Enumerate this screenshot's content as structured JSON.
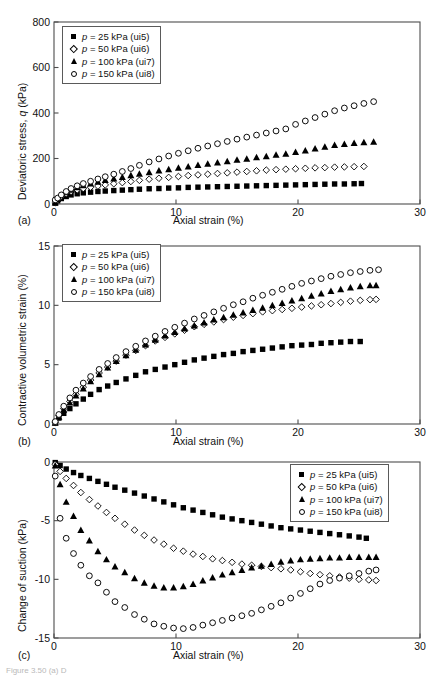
{
  "figure": {
    "caption_fragment": "Figure 3.50 (a) D",
    "panel_labels": [
      "(a)",
      "(b)",
      "(c)"
    ],
    "xlabel": "Axial strain (%)",
    "series_styles": [
      "filled-square",
      "open-diamond",
      "filled-triangle",
      "open-circle"
    ],
    "legend_labels": [
      "p = 25 kPa (ui5)",
      "p = 50 kPa (ui6)",
      "p = 100 kPa (ui7)",
      "p = 150 kPa (ui8)"
    ],
    "legend_parts": [
      {
        "sym": "p",
        "rest": " = 25 kPa (ui5)"
      },
      {
        "sym": "p",
        "rest": " = 50 kPa (ui6)"
      },
      {
        "sym": "p",
        "rest": " = 100 kPa (ui7)"
      },
      {
        "sym": "p",
        "rest": " = 150 kPa (ui8)"
      }
    ]
  },
  "chart_data": [
    {
      "panel": "(a)",
      "type": "scatter",
      "title": "",
      "xlabel": "Axial strain (%)",
      "ylabel": "Deviatoric stress, q (kPa)",
      "ylabel_plain": "Deviatoric stress, q (kPa)",
      "xlim": [
        0,
        30
      ],
      "ylim": [
        0,
        800
      ],
      "xticks": [
        0,
        10,
        20,
        30
      ],
      "yticks": [
        0,
        200,
        400,
        600,
        800
      ],
      "grid": false,
      "legend_position": "top-left",
      "series": [
        {
          "name": "p = 25 kPa (ui5)",
          "marker": "filled-square",
          "x": [
            0.1,
            0.3,
            0.6,
            1.0,
            1.4,
            1.9,
            2.4,
            3.0,
            3.6,
            4.2,
            4.9,
            5.6,
            6.3,
            7.0,
            7.8,
            8.6,
            9.4,
            10.2,
            11.0,
            11.8,
            12.6,
            13.4,
            14.2,
            15.0,
            15.8,
            16.6,
            17.4,
            18.2,
            19.0,
            19.8,
            20.6,
            21.4,
            22.2,
            23.0,
            23.8,
            24.6,
            25.2
          ],
          "y": [
            4,
            14,
            24,
            33,
            40,
            45,
            49,
            52,
            55,
            57,
            59,
            61,
            63,
            65,
            67,
            68,
            70,
            71,
            73,
            74,
            75,
            76,
            77,
            78,
            79,
            80,
            81,
            82,
            83,
            84,
            85,
            86,
            87,
            88,
            88,
            89,
            90
          ]
        },
        {
          "name": "p = 50 kPa (ui6)",
          "marker": "open-diamond",
          "x": [
            0.1,
            0.3,
            0.6,
            1.0,
            1.4,
            1.9,
            2.4,
            3.0,
            3.6,
            4.2,
            4.9,
            5.6,
            6.3,
            7.0,
            7.8,
            8.6,
            9.4,
            10.2,
            11.0,
            11.8,
            12.6,
            13.4,
            14.2,
            15.0,
            15.8,
            16.6,
            17.4,
            18.2,
            19.0,
            19.8,
            20.6,
            21.4,
            22.2,
            23.0,
            23.8,
            24.6,
            25.4
          ],
          "y": [
            6,
            19,
            33,
            45,
            55,
            62,
            68,
            74,
            79,
            84,
            89,
            94,
            99,
            104,
            109,
            113,
            117,
            121,
            125,
            128,
            131,
            134,
            137,
            140,
            143,
            146,
            149,
            151,
            153,
            155,
            157,
            159,
            160,
            162,
            163,
            164,
            165
          ]
        },
        {
          "name": "p = 100 kPa (ui7)",
          "marker": "filled-triangle",
          "x": [
            0.1,
            0.3,
            0.6,
            1.0,
            1.4,
            1.9,
            2.4,
            3.0,
            3.6,
            4.2,
            4.9,
            5.6,
            6.3,
            7.0,
            7.8,
            8.6,
            9.4,
            10.2,
            11.0,
            11.8,
            12.6,
            13.4,
            14.2,
            15.0,
            15.8,
            16.6,
            17.4,
            18.2,
            19.0,
            19.8,
            20.6,
            21.4,
            22.2,
            23.0,
            23.8,
            24.6,
            25.4,
            26.2
          ],
          "y": [
            7,
            22,
            38,
            52,
            63,
            73,
            82,
            90,
            98,
            105,
            112,
            119,
            126,
            133,
            140,
            147,
            153,
            159,
            165,
            171,
            177,
            182,
            188,
            194,
            199,
            205,
            210,
            216,
            221,
            229,
            235,
            244,
            252,
            259,
            264,
            268,
            271,
            274
          ]
        },
        {
          "name": "p = 150 kPa (ui8)",
          "marker": "open-circle",
          "x": [
            0.1,
            0.3,
            0.6,
            1.0,
            1.4,
            1.9,
            2.4,
            3.0,
            3.6,
            4.2,
            4.9,
            5.6,
            6.3,
            7.0,
            7.8,
            8.6,
            9.4,
            10.2,
            11.0,
            11.8,
            12.6,
            13.4,
            14.2,
            15.0,
            15.8,
            16.6,
            17.4,
            18.2,
            19.0,
            19.8,
            20.6,
            21.4,
            22.2,
            23.0,
            23.8,
            24.6,
            25.4,
            26.2
          ],
          "y": [
            18,
            26,
            40,
            55,
            68,
            80,
            90,
            100,
            110,
            120,
            131,
            143,
            156,
            170,
            185,
            198,
            211,
            223,
            234,
            245,
            255,
            265,
            275,
            285,
            294,
            303,
            312,
            321,
            330,
            350,
            365,
            380,
            395,
            410,
            422,
            432,
            442,
            450
          ]
        }
      ]
    },
    {
      "panel": "(b)",
      "type": "scatter",
      "title": "",
      "xlabel": "Axial strain (%)",
      "ylabel": "Contractive volumetric strain (%)",
      "ylabel_plain": "Contractive volumetric strain (%)",
      "xlim": [
        0,
        30
      ],
      "ylim": [
        0,
        15
      ],
      "xticks": [
        0,
        10,
        20,
        30
      ],
      "yticks": [
        0,
        5,
        10,
        15
      ],
      "grid": false,
      "legend_position": "top-left",
      "series": [
        {
          "name": "p = 25 kPa (ui5)",
          "marker": "filled-square",
          "x": [
            0.1,
            0.4,
            0.8,
            1.3,
            1.8,
            2.4,
            3.0,
            3.7,
            4.4,
            5.1,
            5.9,
            6.7,
            7.5,
            8.3,
            9.1,
            9.9,
            10.7,
            11.5,
            12.3,
            13.1,
            13.9,
            14.7,
            15.5,
            16.3,
            17.1,
            17.9,
            18.7,
            19.5,
            20.3,
            21.1,
            21.9,
            22.7,
            23.5,
            24.3,
            25.1
          ],
          "y": [
            0.1,
            0.5,
            0.9,
            1.3,
            1.7,
            2.1,
            2.5,
            2.9,
            3.2,
            3.5,
            3.8,
            4.1,
            4.4,
            4.6,
            4.8,
            5.0,
            5.2,
            5.4,
            5.55,
            5.7,
            5.85,
            5.95,
            6.1,
            6.2,
            6.3,
            6.4,
            6.5,
            6.6,
            6.65,
            6.7,
            6.8,
            6.85,
            6.9,
            6.95,
            6.95
          ]
        },
        {
          "name": "p = 50 kPa (ui6)",
          "marker": "open-diamond",
          "x": [
            0.1,
            0.4,
            0.8,
            1.3,
            1.8,
            2.4,
            3.0,
            3.7,
            4.4,
            5.1,
            5.9,
            6.7,
            7.5,
            8.3,
            9.1,
            9.9,
            10.7,
            11.5,
            12.3,
            13.1,
            13.9,
            14.7,
            15.5,
            16.3,
            17.1,
            17.9,
            18.7,
            19.5,
            20.3,
            21.1,
            21.9,
            22.7,
            23.5,
            24.3,
            25.1,
            25.9,
            26.4
          ],
          "y": [
            0.15,
            0.7,
            1.3,
            1.9,
            2.5,
            3.1,
            3.7,
            4.3,
            4.8,
            5.3,
            5.8,
            6.2,
            6.6,
            7.0,
            7.3,
            7.6,
            7.9,
            8.2,
            8.4,
            8.6,
            8.8,
            9.0,
            9.15,
            9.3,
            9.45,
            9.55,
            9.65,
            9.75,
            9.85,
            9.95,
            10.05,
            10.15,
            10.25,
            10.35,
            10.42,
            10.48,
            10.5
          ]
        },
        {
          "name": "p = 100 kPa (ui7)",
          "marker": "filled-triangle",
          "x": [
            0.1,
            0.4,
            0.8,
            1.3,
            1.8,
            2.4,
            3.0,
            3.7,
            4.4,
            5.1,
            5.9,
            6.7,
            7.5,
            8.3,
            9.1,
            9.9,
            10.7,
            11.5,
            12.3,
            13.1,
            13.9,
            14.7,
            15.5,
            16.3,
            17.1,
            17.9,
            18.7,
            19.5,
            20.3,
            21.1,
            21.9,
            22.7,
            23.5,
            24.3,
            25.1,
            25.9,
            26.4
          ],
          "y": [
            0.1,
            0.6,
            1.2,
            1.8,
            2.4,
            3.0,
            3.6,
            4.2,
            4.75,
            5.3,
            5.8,
            6.25,
            6.7,
            7.1,
            7.45,
            7.75,
            8.05,
            8.3,
            8.55,
            8.8,
            9.0,
            9.2,
            9.4,
            9.6,
            9.8,
            10.0,
            10.2,
            10.4,
            10.6,
            10.8,
            11.0,
            11.2,
            11.35,
            11.5,
            11.6,
            11.68,
            11.7
          ]
        },
        {
          "name": "p = 150 kPa (ui8)",
          "marker": "open-circle",
          "x": [
            0.1,
            0.4,
            0.8,
            1.3,
            1.8,
            2.4,
            3.0,
            3.7,
            4.4,
            5.1,
            5.9,
            6.7,
            7.5,
            8.3,
            9.1,
            9.9,
            10.7,
            11.5,
            12.3,
            13.1,
            13.9,
            14.7,
            15.5,
            16.3,
            17.1,
            17.9,
            18.7,
            19.5,
            20.3,
            21.1,
            21.9,
            22.7,
            23.5,
            24.3,
            25.1,
            25.9,
            26.6
          ],
          "y": [
            0.2,
            0.8,
            1.5,
            2.2,
            2.85,
            3.45,
            4.0,
            4.6,
            5.1,
            5.6,
            6.1,
            6.55,
            7.0,
            7.4,
            7.8,
            8.15,
            8.5,
            8.85,
            9.15,
            9.45,
            9.75,
            10.05,
            10.3,
            10.6,
            10.85,
            11.1,
            11.35,
            11.6,
            11.85,
            12.05,
            12.25,
            12.45,
            12.6,
            12.75,
            12.85,
            12.95,
            13.0
          ]
        }
      ]
    },
    {
      "panel": "(c)",
      "type": "scatter",
      "title": "",
      "xlabel": "Axial strain (%)",
      "ylabel": "Change of suction (kPa)",
      "ylabel_plain": "Change of suction (kPa)",
      "xlim": [
        0,
        30
      ],
      "ylim": [
        -15,
        0
      ],
      "xticks": [
        0,
        10,
        20,
        30
      ],
      "yticks": [
        0,
        -5,
        -10,
        -15
      ],
      "grid": false,
      "legend_position": "top-right",
      "series": [
        {
          "name": "p = 25 kPa (ui5)",
          "marker": "filled-square",
          "x": [
            0.1,
            0.5,
            1.0,
            1.6,
            2.2,
            2.9,
            3.6,
            4.3,
            5.0,
            5.8,
            6.6,
            7.4,
            8.2,
            9.0,
            9.8,
            10.6,
            11.4,
            12.2,
            13.0,
            13.8,
            14.6,
            15.4,
            16.2,
            17.0,
            17.8,
            18.6,
            19.4,
            20.2,
            21.0,
            21.8,
            22.6,
            23.4,
            24.2,
            25.0,
            25.6
          ],
          "y": [
            -0.05,
            -0.3,
            -0.6,
            -0.9,
            -1.15,
            -1.4,
            -1.65,
            -1.9,
            -2.15,
            -2.4,
            -2.65,
            -2.9,
            -3.15,
            -3.4,
            -3.65,
            -3.9,
            -4.1,
            -4.3,
            -4.5,
            -4.7,
            -4.85,
            -5.0,
            -5.15,
            -5.3,
            -5.45,
            -5.6,
            -5.7,
            -5.8,
            -5.9,
            -6.0,
            -6.1,
            -6.2,
            -6.3,
            -6.4,
            -6.5
          ]
        },
        {
          "name": "p = 50 kPa (ui6)",
          "marker": "open-diamond",
          "x": [
            0.1,
            0.5,
            1.0,
            1.6,
            2.2,
            2.9,
            3.6,
            4.3,
            5.0,
            5.8,
            6.6,
            7.4,
            8.2,
            9.0,
            9.8,
            10.6,
            11.4,
            12.2,
            13.0,
            13.8,
            14.6,
            15.4,
            16.2,
            17.0,
            17.8,
            18.6,
            19.4,
            20.2,
            21.0,
            21.8,
            22.6,
            23.4,
            24.2,
            25.0,
            25.8,
            26.4
          ],
          "y": [
            -0.2,
            -0.8,
            -1.4,
            -2.0,
            -2.6,
            -3.2,
            -3.75,
            -4.3,
            -4.8,
            -5.3,
            -5.8,
            -6.25,
            -6.65,
            -7.0,
            -7.35,
            -7.6,
            -7.85,
            -8.05,
            -8.25,
            -8.4,
            -8.55,
            -8.7,
            -8.8,
            -8.9,
            -9.0,
            -9.1,
            -9.2,
            -9.35,
            -9.5,
            -9.6,
            -9.7,
            -9.8,
            -9.9,
            -10.0,
            -10.05,
            -10.1
          ]
        },
        {
          "name": "p = 100 kPa (ui7)",
          "marker": "filled-triangle",
          "x": [
            0.1,
            0.5,
            1.0,
            1.6,
            2.2,
            2.9,
            3.6,
            4.3,
            5.0,
            5.8,
            6.6,
            7.4,
            8.2,
            9.0,
            9.8,
            10.6,
            11.4,
            12.2,
            13.0,
            13.8,
            14.6,
            15.4,
            16.2,
            17.0,
            17.8,
            18.6,
            19.4,
            20.2,
            21.0,
            21.8,
            22.6,
            23.4,
            24.2,
            25.0,
            25.8,
            26.4
          ],
          "y": [
            -0.3,
            -1.9,
            -3.4,
            -4.6,
            -5.8,
            -6.7,
            -7.6,
            -8.3,
            -8.9,
            -9.4,
            -9.9,
            -10.3,
            -10.55,
            -10.7,
            -10.7,
            -10.6,
            -10.4,
            -10.1,
            -9.85,
            -9.6,
            -9.4,
            -9.2,
            -9.0,
            -8.85,
            -8.7,
            -8.5,
            -8.4,
            -8.3,
            -8.25,
            -8.2,
            -8.15,
            -8.15,
            -8.1,
            -8.1,
            -8.1,
            -8.1
          ]
        },
        {
          "name": "p = 150 kPa (ui8)",
          "marker": "open-circle",
          "x": [
            0.1,
            0.5,
            1.0,
            1.6,
            2.2,
            2.9,
            3.6,
            4.3,
            5.0,
            5.8,
            6.6,
            7.4,
            8.2,
            9.0,
            9.8,
            10.6,
            11.4,
            12.2,
            13.0,
            13.8,
            14.6,
            15.4,
            16.2,
            17.0,
            17.8,
            18.6,
            19.4,
            20.2,
            21.0,
            21.8,
            22.6,
            23.4,
            24.2,
            25.0,
            25.8,
            26.4
          ],
          "y": [
            -1.2,
            -4.8,
            -6.5,
            -7.8,
            -8.8,
            -9.7,
            -10.3,
            -11.1,
            -11.9,
            -12.4,
            -13.0,
            -13.4,
            -13.8,
            -14.0,
            -14.15,
            -14.2,
            -14.1,
            -13.9,
            -13.7,
            -13.5,
            -13.3,
            -13.1,
            -12.9,
            -12.6,
            -12.3,
            -12.0,
            -11.6,
            -11.2,
            -10.8,
            -10.4,
            -10.1,
            -9.9,
            -9.7,
            -9.5,
            -9.3,
            -9.2
          ]
        }
      ]
    }
  ]
}
